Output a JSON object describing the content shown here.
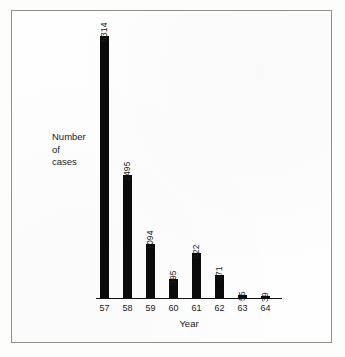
{
  "figure": {
    "background_color": "#fdfdfc",
    "border_color": "#8e8e8e",
    "bar_color": "#0a0a0a",
    "text_color": "#1a1a1a"
  },
  "axis": {
    "y_title_lines": [
      "Number",
      "of",
      "cases"
    ],
    "x_title": "Year"
  },
  "chart_data": {
    "type": "bar",
    "title": "",
    "xlabel": "Year",
    "ylabel": "Number of cases",
    "categories": [
      "57",
      "58",
      "59",
      "60",
      "61",
      "62",
      "63",
      "64"
    ],
    "values": [
      5314,
      2495,
      1094,
      395,
      922,
      471,
      55,
      39
    ],
    "value_labels": [
      "5314",
      "2495",
      "1094",
      "395",
      "922",
      "471",
      "55",
      "39"
    ],
    "ylim": [
      0,
      5314
    ],
    "grid": false,
    "legend": false,
    "orientation": "vertical",
    "value_label_rotation_deg": -90,
    "value_label_position": "above-bar",
    "y_axis_visible": false,
    "x_axis_visible": true
  }
}
